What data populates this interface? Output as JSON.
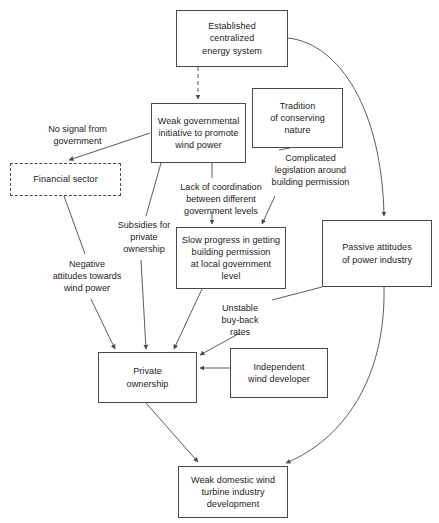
{
  "diagram": {
    "type": "causal-loop-diagram",
    "canvas": {
      "width": 439,
      "height": 523
    },
    "style": {
      "box_border_color": "#4a4a4a",
      "dashed_box_border_color": "#4a4a4a",
      "arrow_color": "#4a4a4a",
      "background": "#ffffff",
      "text_color": "#1c1c1c"
    },
    "nodes": [
      {
        "id": "established-centralized-energy-system",
        "label": "Established\ncentralized\nenergy system",
        "x": 176,
        "y": 10,
        "w": 112,
        "h": 57,
        "border": "solid"
      },
      {
        "id": "weak-governmental-initiative",
        "label": "Weak governmental\ninitiative to promote\nwind power",
        "x": 151,
        "y": 103,
        "w": 95,
        "h": 60,
        "border": "solid"
      },
      {
        "id": "tradition-of-conserving-nature",
        "label": "Tradition\nof conserving\nnature",
        "x": 252,
        "y": 88,
        "w": 91,
        "h": 60,
        "border": "solid"
      },
      {
        "id": "financial-sector",
        "label": "Financial sector",
        "x": 10,
        "y": 163,
        "w": 111,
        "h": 33,
        "border": "dashed"
      },
      {
        "id": "slow-progress-building-permission",
        "label": "Slow progress in getting\nbuilding permission\nat local government\nlevel",
        "x": 176,
        "y": 227,
        "w": 110,
        "h": 62,
        "border": "solid"
      },
      {
        "id": "passive-attitudes-power-industry",
        "label": "Passive attitudes\nof  power industry",
        "x": 322,
        "y": 220,
        "w": 110,
        "h": 67,
        "border": "solid"
      },
      {
        "id": "private-ownership",
        "label": "Private\nownership",
        "x": 98,
        "y": 352,
        "w": 99,
        "h": 51,
        "border": "solid"
      },
      {
        "id": "independent-wind-developer",
        "label": "Independent\nwind developer",
        "x": 230,
        "y": 348,
        "w": 98,
        "h": 50,
        "border": "solid"
      },
      {
        "id": "weak-domestic-wind-turbine-industry",
        "label": "Weak domestic wind\nturbine industry\ndevelopment",
        "x": 178,
        "y": 466,
        "w": 110,
        "h": 52,
        "border": "solid"
      }
    ],
    "edge_labels": [
      {
        "id": "no-signal-from-government",
        "label": "No signal from\ngovernment",
        "x": 20,
        "y": 123,
        "w": 115
      },
      {
        "id": "lack-of-coordination",
        "label": "Lack of coordination\nbetween different\ngovernment levels",
        "x": 164,
        "y": 181,
        "w": 114
      },
      {
        "id": "complicated-legislation",
        "label": "Complicated\nlegislation around\nbuilding permission",
        "x": 257,
        "y": 152,
        "w": 107
      },
      {
        "id": "subsidies-for-private-ownership",
        "label": "Subsidies for\nprivate\nownership",
        "x": 113,
        "y": 219,
        "w": 62
      },
      {
        "id": "negative-attitudes-towards-wind-power",
        "label": "Negative\nattitudes towards\nwind power",
        "x": 41,
        "y": 258,
        "w": 92
      },
      {
        "id": "unstable-buy-back-rates",
        "label": "Unstable\nbuy-back\nrates",
        "x": 213,
        "y": 302,
        "w": 54
      }
    ],
    "edges": [
      {
        "id": "edge-energy-system-to-weak-gov",
        "from": "established-centralized-energy-system",
        "to": "weak-governmental-initiative",
        "style": "dashed",
        "arrow": true
      },
      {
        "id": "edge-energy-system-to-passive-attitudes",
        "from": "established-centralized-energy-system",
        "to": "passive-attitudes-power-industry",
        "style": "curved",
        "arrow": true
      },
      {
        "id": "edge-weak-gov-to-financial-sector",
        "from": "weak-governmental-initiative",
        "to": "financial-sector",
        "label": "no-signal-from-government",
        "style": "solid",
        "arrow": true
      },
      {
        "id": "edge-weak-gov-to-slow-progress",
        "from": "weak-governmental-initiative",
        "to": "slow-progress-building-permission",
        "label": "lack-of-coordination",
        "style": "solid",
        "arrow": true
      },
      {
        "id": "edge-weak-gov-to-private-ownership",
        "from": "weak-governmental-initiative",
        "to": "private-ownership",
        "label": "subsidies-for-private-ownership",
        "style": "solid",
        "arrow": true
      },
      {
        "id": "edge-tradition-to-slow-progress",
        "from": "tradition-of-conserving-nature",
        "to": "slow-progress-building-permission",
        "label": "complicated-legislation",
        "style": "solid",
        "arrow": true
      },
      {
        "id": "edge-financial-sector-to-private-ownership",
        "from": "financial-sector",
        "to": "private-ownership",
        "label": "negative-attitudes-towards-wind-power",
        "style": "solid",
        "arrow": true
      },
      {
        "id": "edge-slow-progress-to-private-ownership",
        "from": "slow-progress-building-permission",
        "to": "private-ownership",
        "style": "solid",
        "arrow": true
      },
      {
        "id": "edge-passive-attitudes-to-private-ownership",
        "from": "passive-attitudes-power-industry",
        "to": "private-ownership",
        "label": "unstable-buy-back-rates",
        "style": "solid",
        "arrow": true
      },
      {
        "id": "edge-independent-developer-to-private-ownership",
        "from": "independent-wind-developer",
        "to": "private-ownership",
        "style": "solid",
        "arrow": true
      },
      {
        "id": "edge-private-ownership-to-weak-domestic",
        "from": "private-ownership",
        "to": "weak-domestic-wind-turbine-industry",
        "style": "solid",
        "arrow": true
      },
      {
        "id": "edge-passive-attitudes-to-weak-domestic",
        "from": "passive-attitudes-power-industry",
        "to": "weak-domestic-wind-turbine-industry",
        "style": "curved",
        "arrow": true
      }
    ]
  }
}
